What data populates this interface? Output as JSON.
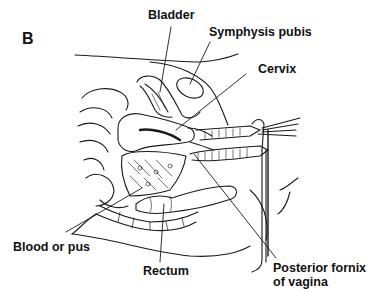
{
  "figure": {
    "panel_letter": "B",
    "background_color": "#ffffff",
    "line_color": "#1a1a1a",
    "labels": {
      "bladder": "Bladder",
      "symphysis_pubis": "Symphysis pubis",
      "cervix": "Cervix",
      "blood_or_pus": "Blood or pus",
      "rectum": "Rectum",
      "posterior_fornix_line1": "Posterior fornix",
      "posterior_fornix_line2": "of vagina"
    }
  }
}
